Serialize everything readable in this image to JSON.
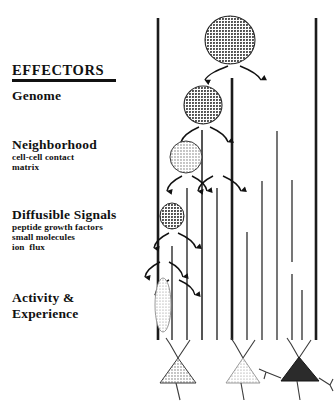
{
  "figure": {
    "section_title": "EFFECTORS",
    "labels": [
      {
        "id": "genome",
        "text": "Genome",
        "kind": "major",
        "x": 12,
        "y": 88
      },
      {
        "id": "neighborhood",
        "text": "Neighborhood",
        "kind": "major",
        "x": 12,
        "y": 137
      },
      {
        "id": "neighborhood-sub-1",
        "text": "cell-cell contact",
        "kind": "minor",
        "x": 12,
        "y": 150
      },
      {
        "id": "neighborhood-sub-2",
        "text": "matrix",
        "kind": "minor",
        "x": 12,
        "y": 160
      },
      {
        "id": "diffusible",
        "text": "Diffusible Signals",
        "kind": "major",
        "x": 12,
        "y": 208
      },
      {
        "id": "diffusible-sub-1",
        "text": "peptide growth factors",
        "kind": "minor",
        "x": 12,
        "y": 221
      },
      {
        "id": "diffusible-sub-2",
        "text": "small molecules",
        "kind": "minor",
        "x": 12,
        "y": 231
      },
      {
        "id": "diffusible-sub-3",
        "text": "ion  flux",
        "kind": "minor",
        "x": 12,
        "y": 241
      },
      {
        "id": "activity",
        "text": "Activity &",
        "kind": "major",
        "x": 12,
        "y": 291
      },
      {
        "id": "experience",
        "text": "Experience",
        "kind": "major",
        "x": 12,
        "y": 307
      }
    ],
    "colors": {
      "ink": "#111111",
      "cell_dark": "#5a5a5a",
      "cell_mid": "#6e6e6e",
      "cell_light": "#9a9a9a",
      "cell_pale": "#b3b3b3",
      "neuron_mid": "#8a8a8a",
      "neuron_light": "#c2c2c2",
      "neuron_dark": "#2b2b2b"
    },
    "lineage": {
      "description": "progenitor cell divisions descending into differentiated neurons",
      "cells": [
        {
          "id": "progenitor-1",
          "cx": 230,
          "cy": 40,
          "rx": 25,
          "ry": 24,
          "shade": "cell_dark"
        },
        {
          "id": "progenitor-2",
          "cx": 203,
          "cy": 105,
          "rx": 19,
          "ry": 19,
          "shade": "cell_dark"
        },
        {
          "id": "progenitor-3",
          "cx": 186,
          "cy": 157,
          "rx": 16,
          "ry": 16,
          "shade": "cell_light"
        },
        {
          "id": "progenitor-4",
          "cx": 172,
          "cy": 215,
          "rx": 12,
          "ry": 13,
          "shade": "cell_dark"
        },
        {
          "id": "precursor-5",
          "cx": 163,
          "cy": 305,
          "rx": 8,
          "ry": 27,
          "shade": "cell_pale"
        }
      ],
      "branches": [
        {
          "x": 158,
          "y1": 18,
          "y2": 340,
          "w": 2.6
        },
        {
          "x": 232,
          "y1": 78,
          "y2": 340,
          "w": 2.6
        },
        {
          "x": 316,
          "y1": 18,
          "y2": 340,
          "w": 2.6
        },
        {
          "x": 202,
          "y1": 130,
          "y2": 340,
          "w": 1.5
        },
        {
          "x": 277,
          "y1": 131,
          "y2": 340,
          "w": 1.2
        },
        {
          "x": 187,
          "y1": 186,
          "y2": 340,
          "w": 1.3
        },
        {
          "x": 217,
          "y1": 186,
          "y2": 340,
          "w": 1.3
        },
        {
          "x": 262,
          "y1": 181,
          "y2": 340,
          "w": 1.2
        },
        {
          "x": 292,
          "y1": 180,
          "y2": 262,
          "w": 1.2
        },
        {
          "x": 292,
          "y1": 272,
          "y2": 340,
          "w": 1.2
        },
        {
          "x": 172,
          "y1": 245,
          "y2": 340,
          "w": 1.3
        },
        {
          "x": 247,
          "y1": 230,
          "y2": 340,
          "w": 1.2
        },
        {
          "x": 302,
          "y1": 288,
          "y2": 340,
          "w": 1.2
        }
      ],
      "division_arrows": [
        {
          "x": 230,
          "y": 64,
          "spread": 26,
          "drop": 16
        },
        {
          "x": 203,
          "y": 126,
          "spread": 19,
          "drop": 14
        },
        {
          "x": 186,
          "y": 176,
          "spread": 16,
          "drop": 13
        },
        {
          "x": 216,
          "y": 176,
          "spread": 16,
          "drop": 13
        },
        {
          "x": 172,
          "y": 232,
          "spread": 15,
          "drop": 13
        },
        {
          "x": 163,
          "y": 262,
          "spread": 14,
          "drop": 13
        },
        {
          "x": 172,
          "y": 278,
          "spread": 14,
          "drop": 13
        }
      ],
      "neurons": [
        {
          "id": "neuron-1",
          "cx": 178,
          "cy": 372,
          "shade": "neuron_mid",
          "lateral": false
        },
        {
          "id": "neuron-2",
          "cx": 243,
          "cy": 372,
          "shade": "neuron_light",
          "lateral": false
        },
        {
          "id": "neuron-3",
          "cx": 299,
          "cy": 372,
          "shade": "neuron_dark",
          "lateral": true
        }
      ]
    }
  }
}
